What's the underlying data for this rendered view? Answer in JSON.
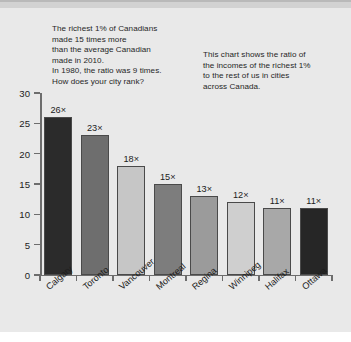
{
  "notes": {
    "left": [
      "The richest 1% of Canadians",
      "made 15 times more",
      "than the average Canadian",
      "made in 2010.",
      "In 1980, the ratio was 9 times.",
      "How does your city rank?"
    ],
    "right": [
      "This chart shows the ratio of",
      "the incomes of the richest 1%",
      "to the rest of us in cities",
      "across Canada."
    ]
  },
  "chart_data": {
    "type": "bar",
    "title": "",
    "subtitle": "",
    "xlabel": "",
    "ylabel": "",
    "ylim": [
      0,
      30
    ],
    "yticks": [
      0,
      5,
      10,
      15,
      20,
      25,
      30
    ],
    "ytick_labels": [
      "0",
      "5",
      "10",
      "15",
      "20",
      "25",
      "30"
    ],
    "grid": false,
    "legend": false,
    "categories": [
      "Calgary",
      "Toronto",
      "Vancouver",
      "Montreal",
      "Regina",
      "Winnipeg",
      "Halifax",
      "Ottawa"
    ],
    "values": [
      26,
      23,
      18,
      15,
      13,
      12,
      11,
      11
    ],
    "value_labels": [
      "26×",
      "23×",
      "18×",
      "15×",
      "13×",
      "12×",
      "11×",
      "11×"
    ],
    "bar_colors": [
      "#2b2b2b",
      "#6e6e6e",
      "#c6c6c6",
      "#7d7d7d",
      "#9b9b9b",
      "#cfcfcf",
      "#a8a8a8",
      "#262626"
    ],
    "bar_border_color": "#4a4a4a",
    "axis_color": "#6d6d6d",
    "background_color": "#e9e9e9",
    "text_color": "#1c1c1c"
  }
}
